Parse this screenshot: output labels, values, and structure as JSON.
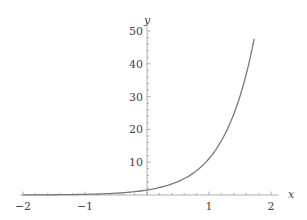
{
  "chart_data": {
    "type": "line",
    "title": "",
    "xlabel": "x",
    "ylabel": "y",
    "xlim": [
      -2,
      2
    ],
    "ylim": [
      0,
      50
    ],
    "x_ticks": [
      "−2",
      "−1",
      "1",
      "2"
    ],
    "x_tick_values": [
      -2,
      -1,
      1,
      2
    ],
    "y_ticks": [
      "10",
      "20",
      "30",
      "40",
      "50"
    ],
    "y_tick_values": [
      10,
      20,
      30,
      40,
      50
    ],
    "grid": false,
    "legend": null,
    "series": [
      {
        "name": "curve",
        "color": "#7a7a7a",
        "x": [
          -2,
          -1.5,
          -1,
          -0.5,
          0,
          0.25,
          0.5,
          0.75,
          1,
          1.25,
          1.5,
          1.73
        ],
        "y": [
          0.03,
          0.07,
          0.2,
          0.55,
          1.5,
          2.5,
          4.1,
          6.7,
          11.1,
          18.3,
          30.1,
          47.7
        ]
      }
    ]
  },
  "axes": {
    "x_label": "x",
    "y_label": "y"
  }
}
